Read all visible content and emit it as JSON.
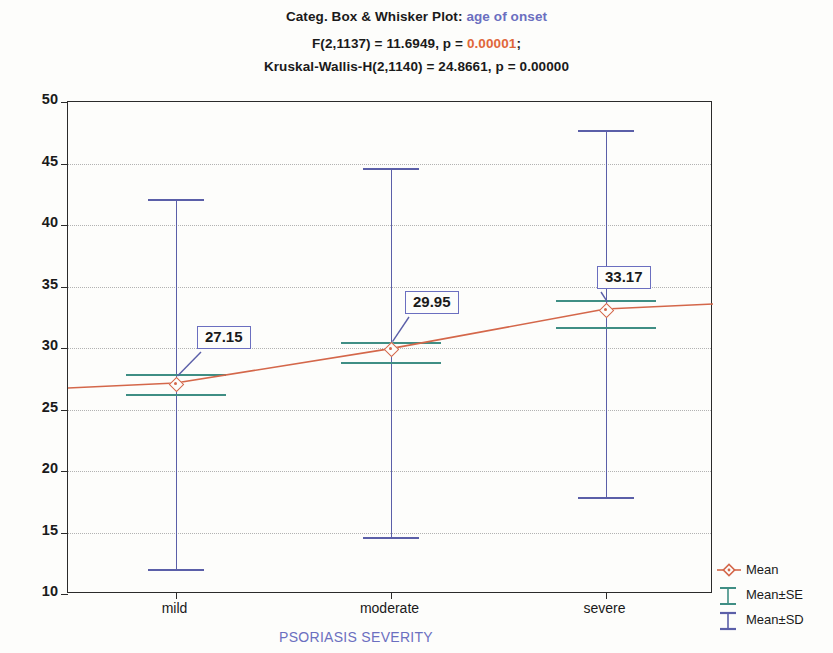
{
  "header": {
    "title_prefix": "Categ. Box & Whisker Plot: ",
    "title_variable": "age of onset",
    "stat_line_1_a": "F(2,1137) = 11.6949, p = ",
    "stat_line_1_p": "0.00001",
    "stat_line_1_b": ";",
    "stat_line_2": "Kruskal-Wallis-H(2,1140) = 24.8661, p = 0.00000"
  },
  "axes": {
    "y_title": "age of onset [year]",
    "x_title": "PSORIASIS SEVERITY",
    "y_ticks": [
      "50",
      "45",
      "40",
      "35",
      "30",
      "25",
      "20",
      "15",
      "10"
    ]
  },
  "legend": {
    "items": [
      {
        "label": "Mean",
        "marker": "mean-marker-icon",
        "color": "#d4674a"
      },
      {
        "label": "Mean±SE",
        "marker": "errorbar-se-icon",
        "color": "#3f8e84"
      },
      {
        "label": "Mean±SD",
        "marker": "errorbar-sd-icon",
        "color": "#5b5fa8"
      }
    ]
  },
  "labels": {
    "mild": "27.15",
    "moderate": "29.95",
    "severe": "33.17"
  },
  "chart_data": {
    "type": "line",
    "plot_kind": "categorized box & whisker (mean / mean±SE / mean±SD)",
    "title": "Categ. Box & Whisker Plot: age of onset",
    "subtitle": "F(2,1137) = 11.6949, p = 0.00001; Kruskal-Wallis-H(2,1140) = 24.8661, p = 0.00000",
    "xlabel": "PSORIASIS SEVERITY",
    "ylabel": "age of onset [year]",
    "ylim": [
      10,
      50
    ],
    "ytick_step": 5,
    "grid": true,
    "legend_position": "right-bottom",
    "categories": [
      "mild",
      "moderate",
      "severe"
    ],
    "series": [
      {
        "name": "Mean",
        "values": [
          27.15,
          29.95,
          33.17
        ]
      },
      {
        "name": "Mean-SE",
        "values": [
          26.3,
          28.9,
          31.7
        ]
      },
      {
        "name": "Mean+SE",
        "values": [
          27.9,
          30.5,
          33.9
        ]
      },
      {
        "name": "Mean-SD",
        "values": [
          12.0,
          14.6,
          17.9
        ]
      },
      {
        "name": "Mean+SD",
        "values": [
          42.1,
          44.6,
          47.7
        ]
      }
    ],
    "statistics": {
      "F_statistic": 11.6949,
      "F_df": "2,1137",
      "F_p": 1e-05,
      "kruskal_wallis_H": 24.8661,
      "kruskal_df": "2,1140",
      "kruskal_p": 0.0
    }
  }
}
